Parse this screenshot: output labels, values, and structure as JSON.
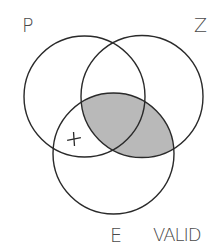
{
  "diagram": {
    "type": "venn-3-set",
    "sets": [
      {
        "id": "P",
        "label": "P",
        "cx": 84.5,
        "cy": 96.5,
        "r": 60.5
      },
      {
        "id": "Z",
        "label": "Z",
        "cx": 142,
        "cy": 96.5,
        "r": 61
      },
      {
        "id": "E",
        "label": "E",
        "cx": 113.5,
        "cy": 153.5,
        "r": 60.5
      }
    ],
    "shaded_region": {
      "description": "E ∩ Z",
      "color": "#b9b9b9"
    },
    "marks": [
      {
        "symbol": "+",
        "region": "P ∩ E only (not Z)",
        "x": 74,
        "y": 139
      }
    ],
    "verdict_label": "VALID",
    "colors": {
      "stroke": "#2a2a2a",
      "label": "#4a4a4a",
      "background": "#ffffff"
    }
  }
}
